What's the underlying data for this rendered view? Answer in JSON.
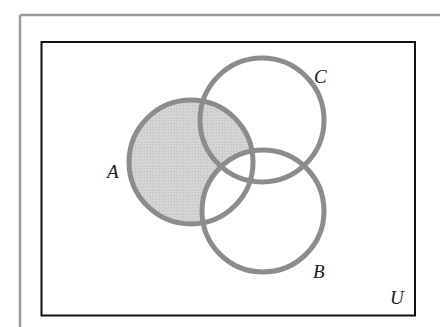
{
  "diagram": {
    "type": "venn",
    "universe_label": "U",
    "sets": [
      {
        "id": "A",
        "label": "A",
        "cx": 191,
        "cy": 162,
        "r": 62
      },
      {
        "id": "B",
        "label": "B",
        "cx": 263,
        "cy": 211,
        "r": 61
      },
      {
        "id": "C",
        "label": "C",
        "cx": 262,
        "cy": 120,
        "r": 62
      }
    ],
    "shaded_region": "A − B",
    "colors": {
      "circle_stroke": "#8c8c8c",
      "shade_fill": "#d2d2d2",
      "universe_border": "#111111",
      "outer_frame": "#9a9a9a",
      "background": "#ffffff",
      "label": "#1a1a1a"
    }
  }
}
